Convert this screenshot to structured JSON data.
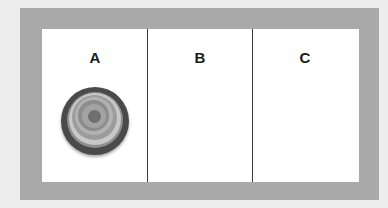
{
  "diagram": {
    "columns": [
      {
        "label": "A",
        "has_figure": true
      },
      {
        "label": "B",
        "has_figure": false
      },
      {
        "label": "C",
        "has_figure": false
      }
    ],
    "figure": {
      "type": "concentric-circles",
      "ring_colors": [
        "#4a4a4a",
        "#8f8f8f",
        "#c4c4c4",
        "#9b9b9b",
        "#b0b0b0",
        "#8a8a8a",
        "#a6a6a6",
        "#6f6f6f"
      ]
    },
    "colors": {
      "background": "#ededed",
      "frame": "#a9a9a9",
      "panel": "#ffffff",
      "divider": "#3a3a3a"
    }
  }
}
